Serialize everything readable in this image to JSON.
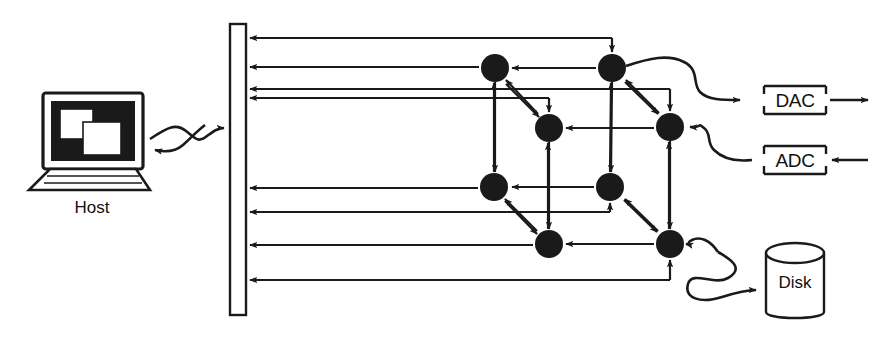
{
  "figure": {
    "type": "block-diagram",
    "title": ""
  },
  "nodes": {
    "host": {
      "label": "Host",
      "icon": "computer-workstation-icon",
      "x": 92,
      "y": 140
    },
    "backplane": {
      "label": "",
      "icon": "bus-backplane-icon",
      "x": 237,
      "y": 170
    },
    "dac": {
      "label": "DAC",
      "x": 795,
      "y": 100
    },
    "adc": {
      "label": "ADC",
      "x": 795,
      "y": 160
    },
    "disk": {
      "label": "Disk",
      "icon": "disk-cylinder-icon",
      "x": 795,
      "y": 275
    }
  },
  "mesh": {
    "node_count": 8,
    "node_radius": 14,
    "node_color": "#1a1a1a",
    "positions": [
      {
        "id": "n1",
        "x": 495,
        "y": 68
      },
      {
        "id": "n2",
        "x": 612,
        "y": 68
      },
      {
        "id": "n3",
        "x": 549,
        "y": 128
      },
      {
        "id": "n4",
        "x": 670,
        "y": 127
      },
      {
        "id": "n5",
        "x": 494,
        "y": 187
      },
      {
        "id": "n6",
        "x": 610,
        "y": 187
      },
      {
        "id": "n7",
        "x": 549,
        "y": 244
      },
      {
        "id": "n8",
        "x": 670,
        "y": 244
      }
    ]
  },
  "bus_arrows": {
    "count": 8,
    "y_positions": [
      38,
      66,
      89,
      98,
      188,
      212,
      246,
      280
    ]
  },
  "style": {
    "line_color": "#1a1a1a",
    "fill_color": "#ffffff",
    "stroke_width": 2.2,
    "background": "#ffffff"
  }
}
